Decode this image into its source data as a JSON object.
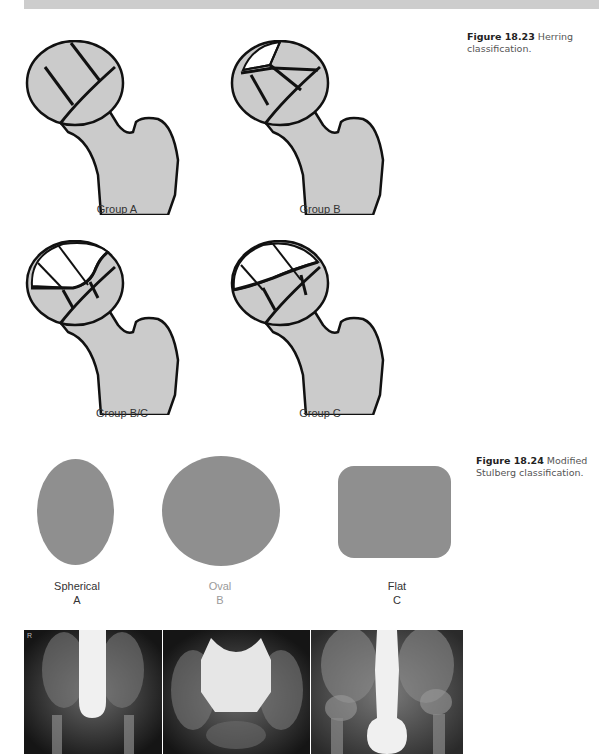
{
  "page": {
    "header_bar_color": "#cdcdcd"
  },
  "figure_18_23": {
    "caption_number": "Figure 18.23",
    "caption_text": " Herring classification.",
    "groups": [
      {
        "label": "Group A"
      },
      {
        "label": "Group B"
      },
      {
        "label": "Group B/C"
      },
      {
        "label": "Group C"
      }
    ],
    "bone_fill_color": "#cbcbcb",
    "outline_color": "#111111"
  },
  "figure_18_24": {
    "caption_number": "Figure 18.24",
    "caption_text": " Modified Stulberg classification.",
    "shapes": [
      {
        "name": "Spherical",
        "letter": "A"
      },
      {
        "name": "Oval",
        "letter": "B"
      },
      {
        "name": "Flat",
        "letter": "C"
      }
    ],
    "shape_fill_color": "#8f8f8f",
    "radiographs": [
      {
        "marker": "R"
      },
      {
        "marker": ""
      },
      {
        "marker": ""
      }
    ]
  }
}
